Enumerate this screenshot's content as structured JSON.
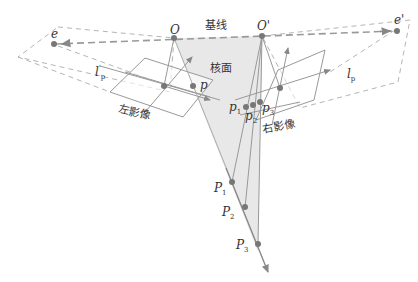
{
  "diagram": {
    "labels": {
      "baseline": "基线",
      "epipolar_plane": "核面",
      "left_image": "左影像",
      "right_image": "右影像",
      "left_center": "O",
      "right_center": "O'",
      "left_epipole": "e",
      "right_epipole": "e'",
      "left_epiline_base": "l",
      "left_epiline_sub": "p",
      "left_epiline_sup": "'",
      "right_epiline_base": "l",
      "right_epiline_sub": "p",
      "left_point": "p",
      "right_points": [
        {
          "base": "p",
          "sub": "1"
        },
        {
          "base": "p",
          "sub": "2"
        },
        {
          "base": "p",
          "sub": "3"
        }
      ],
      "world_points": [
        {
          "base": "P",
          "sub": "1"
        },
        {
          "base": "P",
          "sub": "2"
        },
        {
          "base": "P",
          "sub": "3"
        }
      ]
    },
    "colors": {
      "line": "#888888",
      "dashed": "#aaaaaa",
      "point": "#777777",
      "plane_fill": "#e6e6e6",
      "text": "#333333"
    }
  }
}
